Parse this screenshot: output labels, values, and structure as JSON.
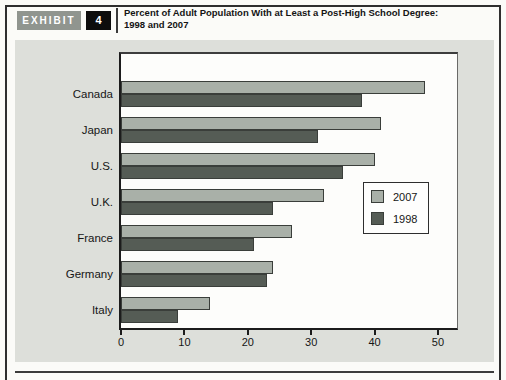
{
  "page": {
    "header": {
      "exhibit_label": "EXHIBIT",
      "exhibit_number": "4",
      "title_line1": "Percent of Adult Population With at Least a Post-High School Degree:",
      "title_line2": "1998 and 2007"
    },
    "colors": {
      "bar_2007": "#a9b0a8",
      "bar_1998": "#555c55",
      "panel_bg": "#dddfda",
      "plot_bg": "#fdfdfb",
      "exhibit_badge_bg": "#90958f",
      "number_badge_bg": "#0d0d0d",
      "frame_border": "#2f2f2f"
    }
  },
  "chart_data": {
    "type": "bar",
    "orientation": "horizontal",
    "title": "Percent of Adult Population With at Least a Post-High School Degree: 1998 and 2007",
    "categories": [
      "Canada",
      "Japan",
      "U.S.",
      "U.K.",
      "France",
      "Germany",
      "Italy"
    ],
    "series": [
      {
        "name": "2007",
        "color": "#a9b0a8",
        "values": [
          48,
          41,
          40,
          32,
          27,
          24,
          14
        ]
      },
      {
        "name": "1998",
        "color": "#555c55",
        "values": [
          38,
          31,
          35,
          24,
          21,
          23,
          9
        ]
      }
    ],
    "xlabel": "",
    "ylabel": "",
    "xlim": [
      0,
      53
    ],
    "xticks": [
      0,
      10,
      20,
      30,
      40,
      50
    ],
    "grid": false,
    "legend_position": "middle-right"
  }
}
